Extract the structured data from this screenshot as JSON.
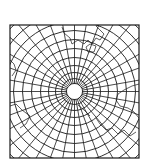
{
  "map": {
    "title": "Polar azimuthal projection graticule",
    "projection": "azimuthal (polar aspect)",
    "frame": {
      "x": 10,
      "y": 25,
      "width": 129,
      "height": 133
    },
    "center": {
      "x": 74.5,
      "y": 91.5
    },
    "pole_hole_radius": 8,
    "parallel_radii": [
      8,
      13,
      19,
      26,
      34,
      43,
      52,
      61,
      70,
      80,
      90
    ],
    "meridian_count": 36,
    "line_color": "#1a1a1a",
    "background_color": "#ffffff",
    "coastlines": [
      {
        "name": "coast-top",
        "points": [
          [
            62,
            27
          ],
          [
            64,
            33
          ],
          [
            70,
            38
          ],
          [
            72,
            44
          ],
          [
            78,
            40
          ],
          [
            84,
            44
          ],
          [
            88,
            40
          ],
          [
            92,
            44
          ],
          [
            96,
            38
          ],
          [
            100,
            40
          ],
          [
            104,
            34
          ],
          [
            100,
            30
          ],
          [
            96,
            26
          ]
        ]
      },
      {
        "name": "coast-top-island",
        "points": [
          [
            86,
            47
          ],
          [
            90,
            44
          ],
          [
            96,
            46
          ],
          [
            94,
            52
          ],
          [
            88,
            52
          ],
          [
            86,
            47
          ]
        ]
      },
      {
        "name": "coast-left",
        "points": [
          [
            10,
            60
          ],
          [
            14,
            64
          ],
          [
            16,
            70
          ],
          [
            12,
            76
          ]
        ]
      },
      {
        "name": "coast-left-lower",
        "points": [
          [
            10,
            106
          ],
          [
            16,
            104
          ],
          [
            22,
            110
          ],
          [
            30,
            116
          ],
          [
            26,
            124
          ],
          [
            20,
            128
          ]
        ]
      },
      {
        "name": "coast-right",
        "points": [
          [
            139,
            84
          ],
          [
            132,
            86
          ],
          [
            124,
            90
          ],
          [
            118,
            94
          ],
          [
            116,
            100
          ],
          [
            120,
            106
          ],
          [
            128,
            108
          ],
          [
            134,
            112
          ],
          [
            139,
            118
          ]
        ]
      },
      {
        "name": "coast-right-lower",
        "points": [
          [
            96,
            118
          ],
          [
            100,
            124
          ],
          [
            106,
            130
          ],
          [
            112,
            128
          ],
          [
            118,
            134
          ],
          [
            124,
            130
          ],
          [
            130,
            136
          ],
          [
            136,
            132
          ]
        ]
      },
      {
        "name": "coast-bottom-inner",
        "points": [
          [
            78,
            105
          ],
          [
            84,
            110
          ],
          [
            90,
            116
          ]
        ]
      }
    ]
  }
}
